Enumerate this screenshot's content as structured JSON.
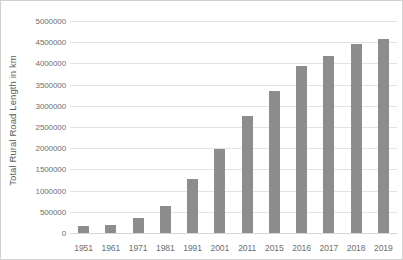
{
  "chart_data": {
    "type": "bar",
    "title": "",
    "subtitle": "",
    "xlabel": "",
    "ylabel": "Total Rural Road Length in km",
    "categories": [
      "1951",
      "1961",
      "1971",
      "1981",
      "1991",
      "2001",
      "2011",
      "2015",
      "2016",
      "2017",
      "2018",
      "2019"
    ],
    "values": [
      170000,
      190000,
      360000,
      630000,
      1270000,
      1980000,
      2760000,
      3350000,
      3950000,
      4180000,
      4450000,
      4570000
    ],
    "series": [
      {
        "name": "Total Rural Road Length in km",
        "values": [
          170000,
          190000,
          360000,
          630000,
          1270000,
          1980000,
          2760000,
          3350000,
          3950000,
          4180000,
          4450000,
          4570000
        ]
      }
    ],
    "ylim": [
      0,
      5000000
    ],
    "ytick_step": 500000,
    "ytick_labels": [
      "0",
      "500000",
      "1000000",
      "1500000",
      "2000000",
      "2500000",
      "3000000",
      "3500000",
      "4000000",
      "4500000",
      "5000000"
    ],
    "ytick_values": [
      0,
      500000,
      1000000,
      1500000,
      2000000,
      2500000,
      3000000,
      3500000,
      4000000,
      4500000,
      5000000
    ],
    "grid": "horizontal",
    "legend": "none",
    "annotations": [],
    "bar_color": "#8d8d8d",
    "gridline_color": "#e2e2e2",
    "axis_text_color": "#6e6e6e",
    "plot_background": "#ffffff",
    "border_color": "#d0d0d0"
  }
}
